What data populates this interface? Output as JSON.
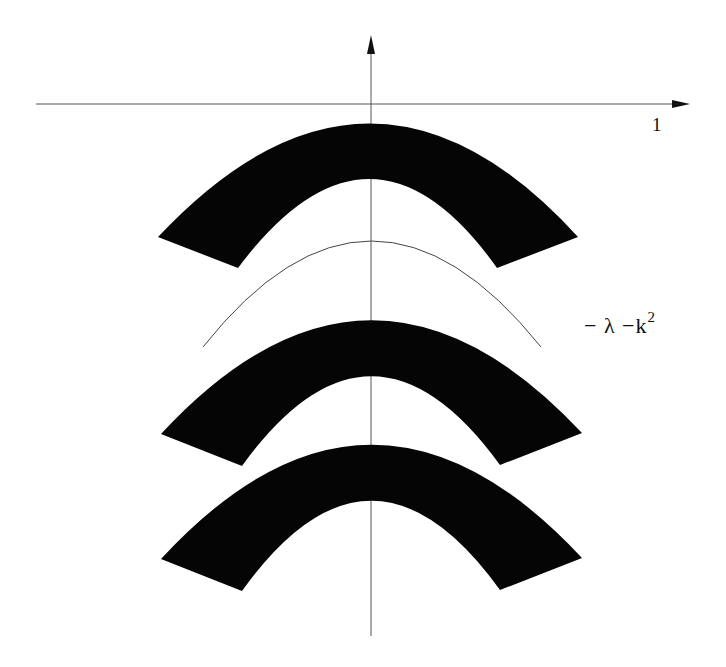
{
  "diagram": {
    "type": "band-spectrum-sketch",
    "axes": {
      "horizontal": {
        "tick_label": "1"
      },
      "vertical": {
        "tick_label": ""
      }
    },
    "curve_label": {
      "minus": "−",
      "lambda": "λ",
      "k_part": "−k",
      "exponent": "2"
    },
    "bands": [
      {
        "name": "upper-band",
        "outer_top_y": 114,
        "inner_top_y": 178
      },
      {
        "name": "middle-band",
        "outer_top_y": 311,
        "inner_top_y": 375
      },
      {
        "name": "lower-band",
        "outer_top_y": 435,
        "inner_top_y": 499
      }
    ],
    "colors": {
      "band_fill": "#050505",
      "axis_line": "#555555",
      "curve_line": "#444444",
      "background": "#ffffff"
    }
  }
}
